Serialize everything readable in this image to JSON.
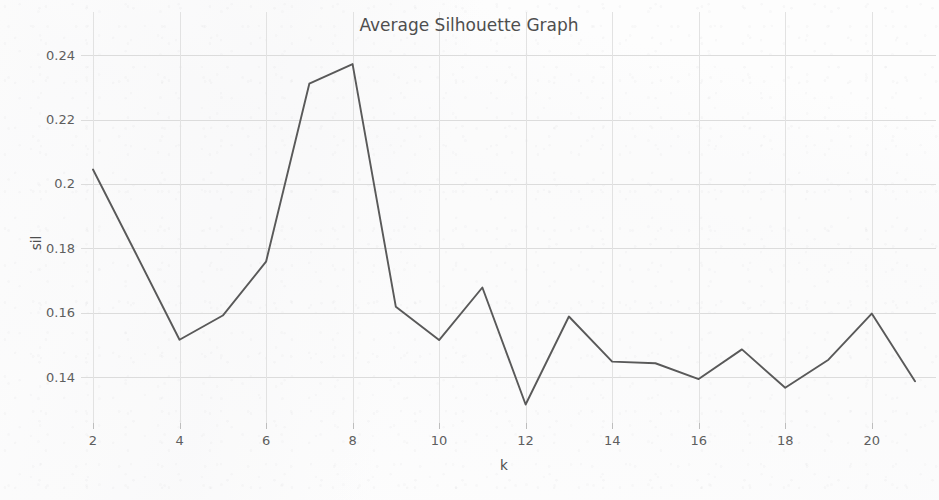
{
  "chart_data": {
    "type": "line",
    "title": "Average Silhouette Graph",
    "xlabel": "k",
    "ylabel": "sil",
    "x": [
      2,
      3,
      4,
      5,
      6,
      7,
      8,
      9,
      10,
      11,
      12,
      13,
      14,
      15,
      16,
      17,
      18,
      19,
      20,
      21
    ],
    "values": [
      0.2045,
      0.1782,
      0.1517,
      0.1592,
      0.1759,
      0.2311,
      0.2372,
      0.1619,
      0.1516,
      0.1679,
      0.1316,
      0.1589,
      0.1449,
      0.1444,
      0.1395,
      0.1487,
      0.1368,
      0.1455,
      0.1598,
      0.1388
    ],
    "series": [
      {
        "name": "sil",
        "values": [
          0.2045,
          0.1782,
          0.1517,
          0.1592,
          0.1759,
          0.2311,
          0.2372,
          0.1619,
          0.1516,
          0.1679,
          0.1316,
          0.1589,
          0.1449,
          0.1444,
          0.1395,
          0.1487,
          0.1368,
          0.1455,
          0.1598,
          0.1388
        ],
        "color": "#595959"
      }
    ],
    "xlim": [
      2,
      21
    ],
    "ylim": [
      0.1268,
      0.2428
    ],
    "xticks": [
      2,
      4,
      6,
      8,
      10,
      12,
      14,
      16,
      18,
      20
    ],
    "xtick_labels": [
      "2",
      "4",
      "6",
      "8",
      "10",
      "12",
      "14",
      "16",
      "18",
      "20"
    ],
    "yticks": [
      0.14,
      0.16,
      0.18,
      0.2,
      0.22,
      0.24
    ],
    "ytick_labels": [
      "0.14",
      "0.16",
      "0.18",
      "0.2",
      "0.22",
      "0.24"
    ],
    "grid": true,
    "legend": false,
    "line_color": "#595959",
    "grid_color": "#dcdcdc",
    "background_color": "#fdfdfd",
    "text_color": "#4e4e4e"
  }
}
